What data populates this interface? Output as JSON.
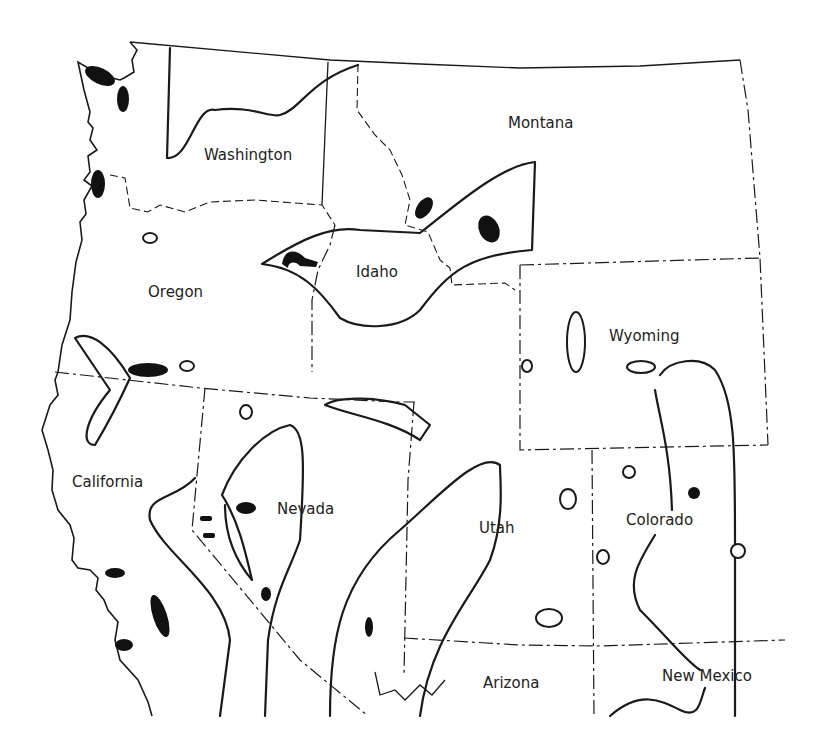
{
  "map": {
    "region": "Western United States",
    "line_color": "#1a1a1a",
    "fill_color": "#111111",
    "background": "#ffffff",
    "states": [
      {
        "name": "Washington",
        "label_x": 204,
        "label_y": 146
      },
      {
        "name": "Montana",
        "label_x": 508,
        "label_y": 114
      },
      {
        "name": "Idaho",
        "label_x": 356,
        "label_y": 263
      },
      {
        "name": "Oregon",
        "label_x": 148,
        "label_y": 283
      },
      {
        "name": "Wyoming",
        "label_x": 609,
        "label_y": 327
      },
      {
        "name": "California",
        "label_x": 72,
        "label_y": 473
      },
      {
        "name": "Nevada",
        "label_x": 277,
        "label_y": 500
      },
      {
        "name": "Utah",
        "label_x": 479,
        "label_y": 519
      },
      {
        "name": "Colorado",
        "label_x": 626,
        "label_y": 511
      },
      {
        "name": "Arizona",
        "label_x": 483,
        "label_y": 674
      },
      {
        "name": "New Mexico",
        "label_x": 662,
        "label_y": 667
      }
    ]
  }
}
